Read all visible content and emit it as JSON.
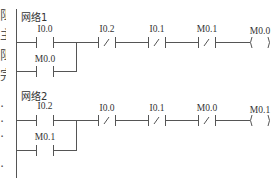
{
  "edge_fragments": [
    "阻",
    "主",
    "阻",
    "完",
    "·",
    "·",
    "·",
    "·"
  ],
  "networks": [
    {
      "label": "网络1",
      "main_contacts": [
        {
          "operand": "I0.0",
          "type": "NO"
        },
        {
          "operand": "I0.2",
          "type": "NC"
        },
        {
          "operand": "I0.1",
          "type": "NC"
        },
        {
          "operand": "M0.1",
          "type": "NC"
        }
      ],
      "branch_contact": {
        "operand": "M0.0",
        "type": "NO"
      },
      "coil": {
        "operand": "M0.0"
      }
    },
    {
      "label": "网络2",
      "main_contacts": [
        {
          "operand": "I0.2",
          "type": "NO"
        },
        {
          "operand": "I0.0",
          "type": "NC"
        },
        {
          "operand": "I0.1",
          "type": "NC"
        },
        {
          "operand": "M0.0",
          "type": "NC"
        }
      ],
      "branch_contact": {
        "operand": "M0.1",
        "type": "NO"
      },
      "coil": {
        "operand": "M0.1"
      }
    }
  ],
  "colors": {
    "line": "#555555",
    "text": "#333333",
    "background": "#ffffff"
  }
}
